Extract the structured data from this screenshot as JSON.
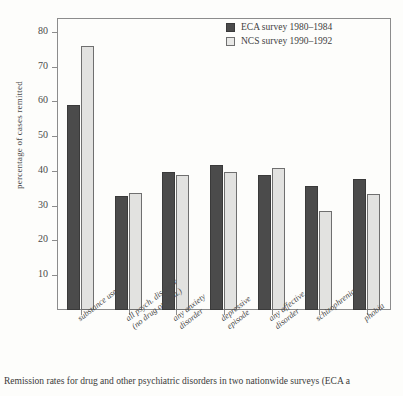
{
  "chart_data": {
    "type": "bar",
    "title": "",
    "xlabel": "",
    "ylabel": "percentage of cases remitted",
    "ylim": [
      0,
      84
    ],
    "yticks": [
      10,
      20,
      30,
      40,
      50,
      60,
      70,
      80
    ],
    "grid": false,
    "legend_position": "top-right",
    "categories": [
      "substance use",
      "all psych. disorder (no drug or alch.)",
      "any anxiety disorder",
      "depressive episode",
      "any affective disorder",
      "schizophrenia",
      "phobia"
    ],
    "category_lines": [
      [
        "substance use"
      ],
      [
        "all psych. disorder",
        "(no drug or alch.)"
      ],
      [
        "any anxiety",
        "disorder"
      ],
      [
        "depressive",
        "episode"
      ],
      [
        "any affective",
        "disorder"
      ],
      [
        "schizophrenia"
      ],
      [
        "phobia"
      ]
    ],
    "series": [
      {
        "name": "ECA  survey 1980–1984",
        "color": "#4b4b4b",
        "values": [
          59.0,
          32.8,
          39.8,
          41.8,
          38.8,
          35.7,
          37.6
        ]
      },
      {
        "name": "NCS survey 1990–1992",
        "color": "#e2e2e0",
        "values": [
          76.0,
          33.8,
          38.8,
          39.8,
          40.8,
          28.6,
          33.4
        ]
      }
    ]
  },
  "legend": {
    "items": [
      {
        "label": "ECA  survey 1980–1984",
        "swatch": "eca"
      },
      {
        "label": "NCS survey 1990–1992",
        "swatch": "ncs"
      }
    ]
  },
  "caption": {
    "text": "Remission rates for drug and other psychiatric disorders in two nationwide surveys (ECA a"
  }
}
